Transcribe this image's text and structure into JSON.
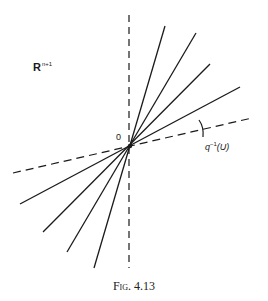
{
  "figure": {
    "caption": "Fig. 4.13",
    "space_label": {
      "base": "R",
      "superscript": "n+1"
    },
    "origin_label": "0",
    "preimage_label": {
      "base": "q",
      "superscript": "−1",
      "arg": "(U)"
    }
  },
  "geometry": {
    "origin": [
      130,
      146
    ],
    "vertical_dashed": {
      "from": [
        129,
        15
      ],
      "to": [
        129,
        268
      ]
    },
    "preimage_dashed": {
      "from": [
        13,
        173
      ],
      "to": [
        252,
        118
      ]
    },
    "solid_lines": [
      {
        "from": [
          94,
          268
        ],
        "to": [
          165,
          26
        ]
      },
      {
        "from": [
          67,
          252
        ],
        "to": [
          196,
          33
        ]
      },
      {
        "from": [
          43,
          232
        ],
        "to": [
          210,
          64
        ]
      },
      {
        "from": [
          20,
          204
        ],
        "to": [
          240,
          87
        ]
      }
    ],
    "tick_mark": {
      "from": [
        201,
        121
      ],
      "to": [
        204,
        136
      ]
    }
  },
  "colors": {
    "ink": "#1a1a1a",
    "background": "#ffffff"
  }
}
